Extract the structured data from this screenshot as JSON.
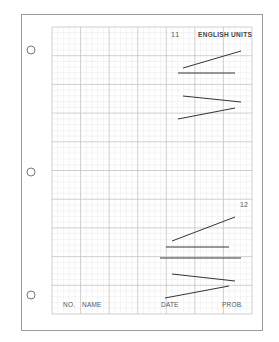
{
  "sheet": {
    "page_border": {
      "x": 21,
      "y": 14,
      "w": 241,
      "h": 316,
      "color": "#9a9a9a"
    },
    "grid": {
      "x": 52,
      "y": 27,
      "cols": 7,
      "rows": 10,
      "cell_w": 28.57,
      "cell_h": 28.7,
      "minor_per_major": 5,
      "major_color": "#c4c4c4",
      "minor_color": "#ececec"
    },
    "holes": [
      {
        "cx": 31,
        "cy": 50,
        "r": 4
      },
      {
        "cx": 31,
        "cy": 172,
        "r": 4
      },
      {
        "cx": 31,
        "cy": 295,
        "r": 4
      }
    ],
    "header": {
      "problem_number": "11",
      "units_label": "ENGLISH UNITS"
    },
    "second_problem": {
      "problem_number": "12"
    },
    "footer": {
      "no_label": "NO.",
      "name_label": "NAME",
      "date_label": "DATE",
      "prob_label": "PROB."
    },
    "line_color": "#333333"
  },
  "problem_11_lines": [
    {
      "x1": 183,
      "y1": 68,
      "x2": 241,
      "y2": 51
    },
    {
      "x1": 178,
      "y1": 73,
      "x2": 235,
      "y2": 73
    },
    {
      "x1": 183,
      "y1": 96,
      "x2": 241,
      "y2": 102
    },
    {
      "x1": 178,
      "y1": 119,
      "x2": 235,
      "y2": 108
    }
  ],
  "problem_12_lines": [
    {
      "x1": 172,
      "y1": 241,
      "x2": 235,
      "y2": 217
    },
    {
      "x1": 166,
      "y1": 247,
      "x2": 229,
      "y2": 247
    },
    {
      "x1": 160,
      "y1": 258,
      "x2": 241,
      "y2": 258
    },
    {
      "x1": 172,
      "y1": 274,
      "x2": 235,
      "y2": 281
    },
    {
      "x1": 165,
      "y1": 298,
      "x2": 229,
      "y2": 286
    }
  ]
}
